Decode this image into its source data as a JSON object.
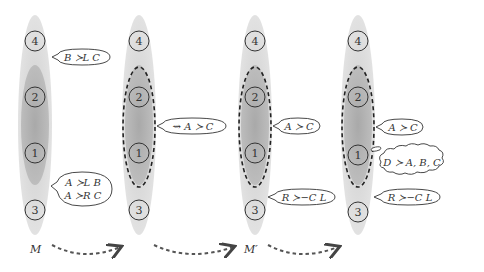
{
  "colors": {
    "outer_region": "#d9d9d9",
    "inner_region": "#b3b3b3",
    "stroke": "#333333",
    "dashed": "#222222",
    "arrow": "#555555"
  },
  "columns": [
    {
      "id": "col1",
      "nodes": [
        "4",
        "2",
        "1",
        "3"
      ],
      "dashed_group": false,
      "bubbles": [
        {
          "id": "b1",
          "lines": [
            "B ≻L C"
          ],
          "anchor": "between-4-2"
        },
        {
          "id": "b2",
          "lines": [
            "A ≻L B",
            "A ≻R C"
          ],
          "anchor": "between-1-3"
        }
      ]
    },
    {
      "id": "col2",
      "nodes": [
        "4",
        "2",
        "1",
        "3"
      ],
      "dashed_group": true,
      "bubbles": [
        {
          "id": "b3",
          "lines": [
            "⇝ A ≻ C"
          ],
          "anchor": "dashed-group"
        }
      ]
    },
    {
      "id": "col3",
      "nodes": [
        "4",
        "2",
        "1",
        "3"
      ],
      "dashed_group": true,
      "bubbles": [
        {
          "id": "b4",
          "lines": [
            "A ≻ C"
          ],
          "anchor": "dashed-group"
        },
        {
          "id": "b5",
          "lines": [
            "R ≻−C L"
          ],
          "anchor": "between-1-3"
        }
      ]
    },
    {
      "id": "col4",
      "nodes": [
        "4",
        "2",
        "1",
        "3"
      ],
      "dashed_group": true,
      "bubbles": [
        {
          "id": "b6",
          "lines": [
            "A ≻ C"
          ],
          "anchor": "dashed-group"
        },
        {
          "id": "b7",
          "lines": [
            "D ≻ A, B, C"
          ],
          "anchor": "node-1",
          "shape": "cloud"
        },
        {
          "id": "b8",
          "lines": [
            "R ≻−C L"
          ],
          "anchor": "between-1-3"
        }
      ]
    }
  ],
  "model_labels": {
    "m": "M",
    "m_prime": "M′"
  },
  "transitions": [
    "col1→col2",
    "col2→col3",
    "col3→col4"
  ]
}
